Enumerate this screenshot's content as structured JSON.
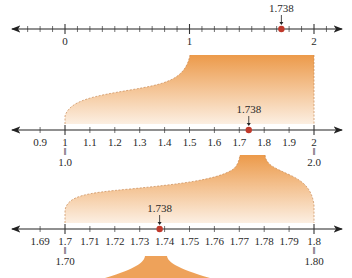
{
  "marker_value": "1.738",
  "colors": {
    "line": "#333333",
    "marker": "#c0392b",
    "fill_dark": "#ec9a4a",
    "fill_light": "#fbe9d8"
  },
  "lines": [
    {
      "name": "line-0-to-2",
      "range": [
        0,
        2
      ],
      "step": 0.1,
      "labels": [
        {
          "value": 0,
          "text": "0"
        },
        {
          "value": 1,
          "text": "1"
        },
        {
          "value": 2,
          "text": "2"
        }
      ],
      "marker_label": "1.738"
    },
    {
      "name": "line-1-to-2",
      "range": [
        0.9,
        2
      ],
      "step": 0.1,
      "labels": [
        {
          "value": 0.9,
          "text": "0.9"
        },
        {
          "value": 1.0,
          "text": "1",
          "alt": "1.0"
        },
        {
          "value": 1.1,
          "text": "1.1"
        },
        {
          "value": 1.2,
          "text": "1.2"
        },
        {
          "value": 1.3,
          "text": "1.3"
        },
        {
          "value": 1.4,
          "text": "1.4"
        },
        {
          "value": 1.5,
          "text": "1.5"
        },
        {
          "value": 1.6,
          "text": "1.6"
        },
        {
          "value": 1.7,
          "text": "1.7"
        },
        {
          "value": 1.8,
          "text": "1.8"
        },
        {
          "value": 1.9,
          "text": "1.9"
        },
        {
          "value": 2.0,
          "text": "2",
          "alt": "2.0"
        }
      ],
      "marker_label": "1.738"
    },
    {
      "name": "line-1.7-to-1.8",
      "range": [
        1.69,
        1.8
      ],
      "step": 0.01,
      "labels": [
        {
          "value": 1.69,
          "text": "1.69"
        },
        {
          "value": 1.7,
          "text": "1.7",
          "alt": "1.70"
        },
        {
          "value": 1.71,
          "text": "1.71"
        },
        {
          "value": 1.72,
          "text": "1.72"
        },
        {
          "value": 1.73,
          "text": "1.73"
        },
        {
          "value": 1.74,
          "text": "1.74"
        },
        {
          "value": 1.75,
          "text": "1.75"
        },
        {
          "value": 1.76,
          "text": "1.76"
        },
        {
          "value": 1.77,
          "text": "1.77"
        },
        {
          "value": 1.78,
          "text": "1.78"
        },
        {
          "value": 1.79,
          "text": "1.79"
        },
        {
          "value": 1.8,
          "text": "1.8",
          "alt": "1.80"
        }
      ],
      "marker_label": "1.738"
    }
  ],
  "equals_sign": "="
}
